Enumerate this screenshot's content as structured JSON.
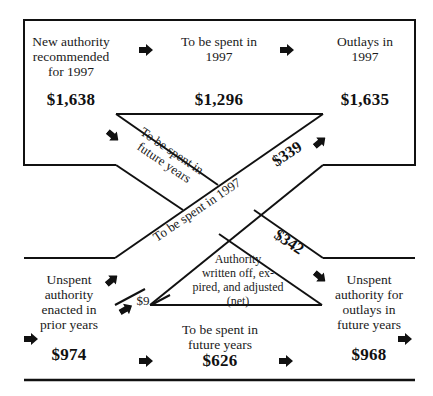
{
  "diagram": {
    "type": "flow",
    "colors": {
      "line": "#111111",
      "background": "#ffffff"
    },
    "top_row": {
      "new_authority": {
        "label": "New authority recommended for 1997",
        "lines": [
          "New authority",
          "recommended",
          "for 1997"
        ],
        "value": "$1,638"
      },
      "spent_1997": {
        "label": "To be spent in 1997",
        "lines": [
          "To be spent in",
          "1997"
        ],
        "value": "$1,296"
      },
      "outlays_1997": {
        "label": "Outlays in 1997",
        "lines": [
          "Outlays in",
          "1997"
        ],
        "value": "$1,635"
      }
    },
    "bottom_row": {
      "unspent_prior": {
        "label": "Unspent authority enacted in prior years",
        "lines": [
          "Unspent",
          "authority",
          "enacted in",
          "prior years"
        ],
        "value": "$974"
      },
      "spent_future": {
        "label": "To be spent in future years",
        "lines": [
          "To be spent in",
          "future years"
        ],
        "value": "$626"
      },
      "unspent_future": {
        "label": "Unspent authority for outlays in future years",
        "lines": [
          "Unspent",
          "authority for",
          "outlays in",
          "future years"
        ],
        "value": "$968"
      }
    },
    "crossing_bands": {
      "new_to_future": {
        "lines": [
          "To be spent in",
          "future years"
        ],
        "value": "$342"
      },
      "prior_to_1997": {
        "label": "To be spent in 1997",
        "value": "$339"
      }
    },
    "written_off": {
      "lines": [
        "Authority",
        "written off, ex-",
        "pired, and adjusted",
        "(net)"
      ],
      "value": "$9"
    },
    "icons": [
      "arrow-right-icon",
      "arrow-down-right-icon",
      "arrow-up-right-icon"
    ]
  }
}
